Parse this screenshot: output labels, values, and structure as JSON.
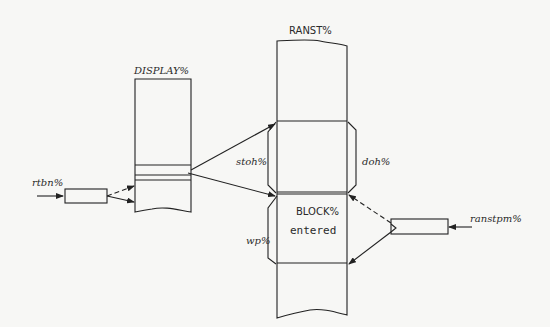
{
  "diagram": {
    "labels": {
      "display": "DISPLAY%",
      "ranst": "RANST%",
      "rtbn": "rtbn%",
      "stoh": "stoh%",
      "doh": "doh%",
      "wp": "wp%",
      "block": "BLOCK%",
      "entered": "entered",
      "ranstpm": "ranstpm%"
    },
    "colors": {
      "background": "#f7f7f5",
      "ink": "#222222"
    }
  }
}
